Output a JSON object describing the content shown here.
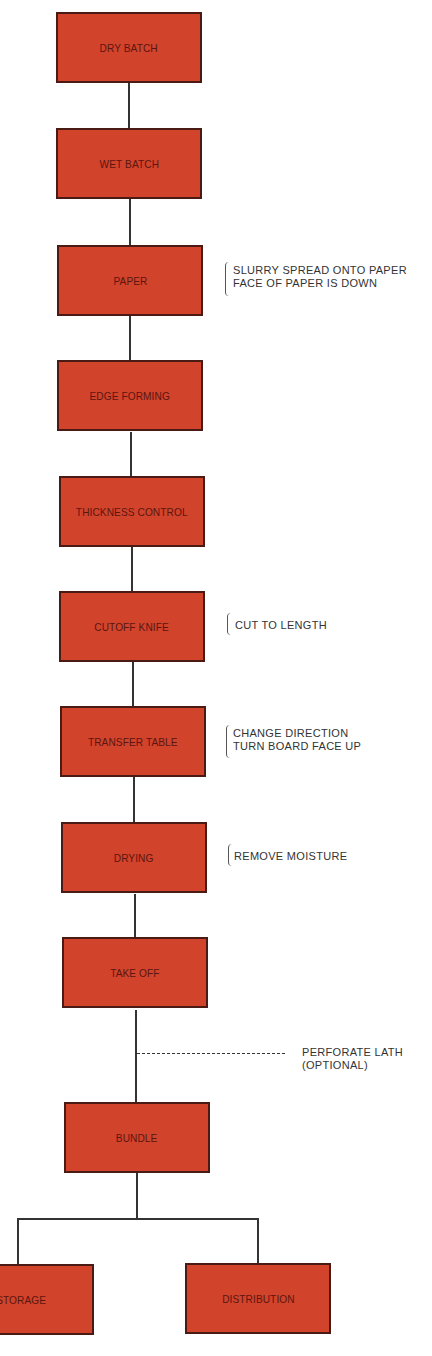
{
  "diagram": {
    "type": "process-flowchart",
    "box_color": "#d2432b",
    "steps": [
      {
        "id": "dry-batch",
        "label": "DRY BATCH"
      },
      {
        "id": "wet-batch",
        "label": "WET BATCH"
      },
      {
        "id": "paper",
        "label": "PAPER",
        "note": [
          "SLURRY SPREAD ONTO PAPER",
          "FACE OF PAPER IS DOWN"
        ]
      },
      {
        "id": "edge-forming",
        "label": "EDGE FORMING"
      },
      {
        "id": "thickness-control",
        "label": "THICKNESS CONTROL"
      },
      {
        "id": "cutoff-knife",
        "label": "CUTOFF KNIFE",
        "note": [
          "CUT TO LENGTH"
        ]
      },
      {
        "id": "transfer-table",
        "label": "TRANSFER TABLE",
        "note": [
          "CHANGE DIRECTION",
          "TURN BOARD FACE UP"
        ]
      },
      {
        "id": "drying",
        "label": "DRYING",
        "note": [
          "REMOVE MOISTURE"
        ]
      },
      {
        "id": "take-off",
        "label": "TAKE OFF"
      },
      {
        "id": "bundle",
        "label": "BUNDLE"
      },
      {
        "id": "storage",
        "label": "STORAGE"
      },
      {
        "id": "distribution",
        "label": "DISTRIBUTION"
      }
    ],
    "optional_branch": {
      "after": "take-off",
      "lines": [
        "PERFORATE LATH",
        "(OPTIONAL)"
      ]
    }
  }
}
